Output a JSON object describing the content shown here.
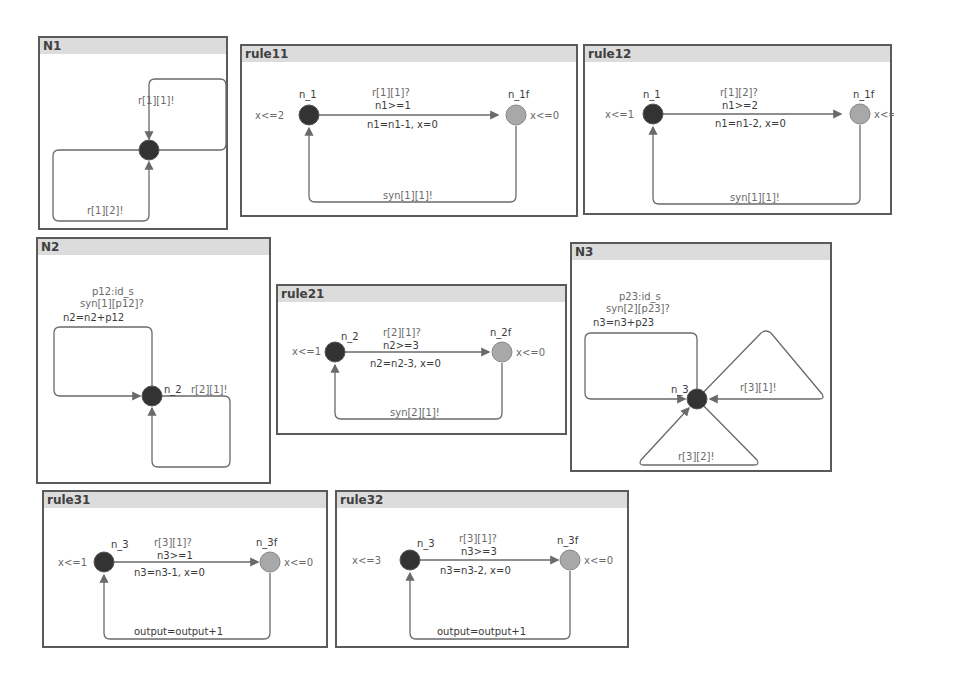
{
  "panels": {
    "N1": {
      "title": "N1",
      "edge_top": "r[1][1]!",
      "edge_bottom": "r[1][2]!"
    },
    "rule11": {
      "title": "rule11",
      "loc_start": "n_1",
      "loc_start_inv": "x<=2",
      "loc_end": "n_1f",
      "loc_end_inv": "x<=0",
      "sync": "r[1][1]?",
      "guard": "n1>=1",
      "update": "n1=n1-1, x=0",
      "return_sync": "syn[1][1]!"
    },
    "rule12": {
      "title": "rule12",
      "loc_start": "n_1",
      "loc_start_inv": "x<=1",
      "loc_end": "n_1f",
      "loc_end_inv": "x<=0",
      "sync": "r[1][2]?",
      "guard": "n1>=2",
      "update": "n1=n1-2, x=0",
      "return_sync": "syn[1][1]!"
    },
    "N2": {
      "title": "N2",
      "select": "p12:id_s",
      "sync": "syn[1][p12]?",
      "update": "n2=n2+p12",
      "loc": "n_2",
      "edge_right": "r[2][1]!"
    },
    "rule21": {
      "title": "rule21",
      "loc_start": "n_2",
      "loc_start_inv": "x<=1",
      "loc_end": "n_2f",
      "loc_end_inv": "x<=0",
      "sync": "r[2][1]?",
      "guard": "n2>=3",
      "update": "n2=n2-3, x=0",
      "return_sync": "syn[2][1]!"
    },
    "N3": {
      "title": "N3",
      "select": "p23:id_s",
      "sync": "syn[2][p23]?",
      "update": "n3=n3+p23",
      "loc": "n_3",
      "edge_right": "r[3][1]!",
      "edge_bottom": "r[3][2]!"
    },
    "rule31": {
      "title": "rule31",
      "loc_start": "n_3",
      "loc_start_inv": "x<=1",
      "loc_end": "n_3f",
      "loc_end_inv": "x<=0",
      "sync": "r[3][1]?",
      "guard": "n3>=1",
      "update": "n3=n3-1, x=0",
      "return_update": "output=output+1"
    },
    "rule32": {
      "title": "rule32",
      "loc_start": "n_3",
      "loc_start_inv": "x<=3",
      "loc_end": "n_3f",
      "loc_end_inv": "x<=0",
      "sync": "r[3][1]?",
      "guard": "n3>=3",
      "update": "n3=n3-2, x=0",
      "return_update": "output=output+1"
    }
  },
  "colors": {
    "border": "#5a5a5a",
    "header_bg": "#dcdcdc",
    "initial_location": "#333333",
    "final_location": "#a8a8a8",
    "edge": "#6a6a6a"
  }
}
